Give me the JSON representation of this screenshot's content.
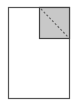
{
  "icon": {
    "name": "page-corner-region-icon",
    "colors": {
      "background": "#ffffff",
      "page_fill": "#ffffff",
      "page_stroke": "#555555",
      "region_fill": "#c8c8c8",
      "region_stroke": "#444444",
      "diagonal_stroke": "#666666"
    }
  }
}
